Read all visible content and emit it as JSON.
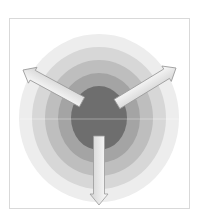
{
  "diagram": {
    "type": "concentric-rings-with-outward-arrows",
    "frame": {
      "border_color": "#d9d9d9"
    },
    "center": {
      "x": 99,
      "y": 118
    },
    "rings": [
      {
        "name": "ring-1-outer",
        "rx": 80,
        "ry": 84,
        "color": "#ededed"
      },
      {
        "name": "ring-2",
        "rx": 67,
        "ry": 71,
        "color": "#d7d7d7"
      },
      {
        "name": "ring-3",
        "rx": 54,
        "ry": 58,
        "color": "#bebebe"
      },
      {
        "name": "ring-4",
        "rx": 41,
        "ry": 45,
        "color": "#a4a4a4"
      },
      {
        "name": "ring-5-core",
        "rx": 28,
        "ry": 32,
        "color": "#6e6e6e"
      }
    ],
    "arrows": [
      {
        "name": "arrow-upper-left",
        "direction": "upper-left",
        "from": [
          82,
          102
        ],
        "to": [
          23,
          70
        ]
      },
      {
        "name": "arrow-upper-right",
        "direction": "upper-right",
        "from": [
          117,
          104
        ],
        "to": [
          176,
          68
        ]
      },
      {
        "name": "arrow-down",
        "direction": "down",
        "from": [
          99,
          136
        ],
        "to": [
          99,
          205
        ]
      }
    ],
    "arrow_style": {
      "fill_start": "#fbfbfb",
      "fill_end": "#d4d4d4",
      "stroke": "#9a9a9a"
    },
    "labels": []
  }
}
